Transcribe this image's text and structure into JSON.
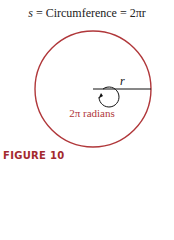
{
  "equation": {
    "lhs": "s",
    "eq1": "=",
    "middle": "Circumference",
    "eq2": "=",
    "rhs": "2πr"
  },
  "diagram": {
    "radius_label": "r",
    "angle_label": "2π radians",
    "outer_circle_color": "#b0373a",
    "angle_label_color": "#b0373a",
    "line_color": "#111111"
  },
  "caption": {
    "label": "FIGURE 10",
    "color": "#a32a2e"
  }
}
